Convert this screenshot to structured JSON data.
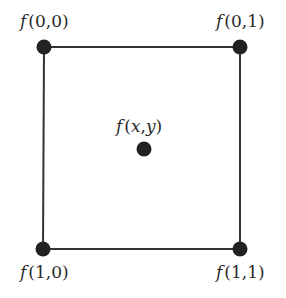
{
  "diagram": {
    "type": "bilinear-interpolation-grid",
    "colors": {
      "line": "#333333",
      "dot": "#222222",
      "text": "#2a2a2a",
      "background": "#ffffff"
    },
    "nodes": [
      {
        "id": "top-left",
        "func": "f",
        "args": "(0,0)",
        "x": 44,
        "y": 47
      },
      {
        "id": "top-right",
        "func": "f",
        "args": "(0,1)",
        "x": 240,
        "y": 47
      },
      {
        "id": "center",
        "func": "f",
        "args": "(x,y)",
        "x": 144,
        "y": 149
      },
      {
        "id": "bottom-left",
        "func": "f",
        "args": "(1,0)",
        "x": 43,
        "y": 249
      },
      {
        "id": "bottom-right",
        "func": "f",
        "args": "(1,1)",
        "x": 240,
        "y": 249
      }
    ],
    "labels": {
      "top_left": {
        "func": "f",
        "args": "(0,0)"
      },
      "top_right": {
        "func": "f",
        "args": "(0,1)"
      },
      "center": {
        "func": "f",
        "open": "(",
        "x": "x",
        "comma": ",",
        "y": "y",
        "close": ")"
      },
      "bottom_left": {
        "func": "f",
        "args": "(1,0)"
      },
      "bottom_right": {
        "func": "f",
        "args": "(1,1)"
      }
    }
  }
}
